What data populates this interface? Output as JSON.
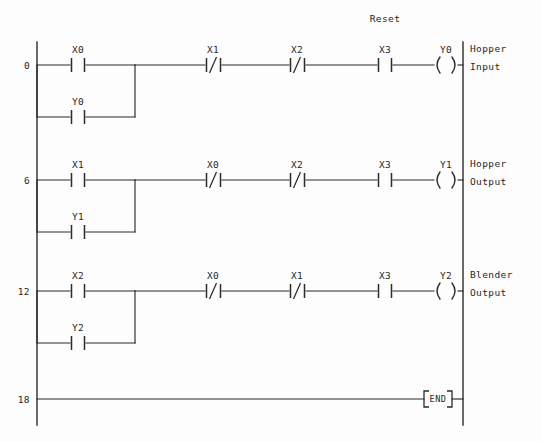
{
  "diagram": {
    "type": "plc-ladder-logic",
    "annotations": [
      {
        "text": "Reset",
        "above_element": "X3",
        "rung": 0
      }
    ],
    "rungs": [
      {
        "number": "0",
        "comment_line1": "Hopper",
        "comment_line2": "Input",
        "main_elements": [
          {
            "kind": "contact-no",
            "label": "X0"
          },
          {
            "kind": "contact-nc",
            "label": "X1"
          },
          {
            "kind": "contact-nc",
            "label": "X2"
          },
          {
            "kind": "contact-no",
            "label": "X3"
          },
          {
            "kind": "coil",
            "label": "Y0"
          }
        ],
        "branch": {
          "kind": "contact-no",
          "label": "Y0"
        }
      },
      {
        "number": "6",
        "comment_line1": "Hopper",
        "comment_line2": "Output",
        "main_elements": [
          {
            "kind": "contact-no",
            "label": "X1"
          },
          {
            "kind": "contact-nc",
            "label": "X0"
          },
          {
            "kind": "contact-nc",
            "label": "X2"
          },
          {
            "kind": "contact-no",
            "label": "X3"
          },
          {
            "kind": "coil",
            "label": "Y1"
          }
        ],
        "branch": {
          "kind": "contact-no",
          "label": "Y1"
        }
      },
      {
        "number": "12",
        "comment_line1": "Blender",
        "comment_line2": "Output",
        "main_elements": [
          {
            "kind": "contact-no",
            "label": "X2"
          },
          {
            "kind": "contact-nc",
            "label": "X0"
          },
          {
            "kind": "contact-nc",
            "label": "X1"
          },
          {
            "kind": "contact-no",
            "label": "X3"
          },
          {
            "kind": "coil",
            "label": "Y2"
          }
        ],
        "branch": {
          "kind": "contact-no",
          "label": "Y2"
        }
      }
    ],
    "end_rung": {
      "number": "18",
      "block_label": "END"
    },
    "colors": {
      "line": "#2b2b2b",
      "text": "#1f1f1f",
      "background": "#fdfdfd"
    }
  }
}
